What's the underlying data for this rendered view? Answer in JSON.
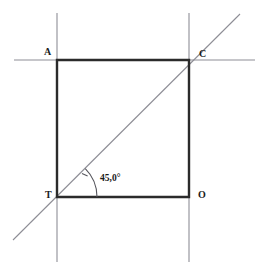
{
  "figure": {
    "width": 271,
    "height": 274,
    "background_color": "#ffffff"
  },
  "colors": {
    "square_stroke": "#2b2b2b",
    "construction_stroke": "#8e8e96",
    "diagonal_stroke": "#8e8e96",
    "arc_stroke": "#55555c",
    "label_color": "#1a1a1a"
  },
  "square": {
    "name": "TACO",
    "stroke_width": 2.4,
    "vertices": [
      {
        "id": "A",
        "label": "A",
        "x": 57,
        "y": 60
      },
      {
        "id": "C",
        "label": "C",
        "x": 189,
        "y": 60
      },
      {
        "id": "O",
        "label": "O",
        "x": 189,
        "y": 197
      },
      {
        "id": "T",
        "label": "T",
        "x": 57,
        "y": 197
      }
    ],
    "edges": [
      {
        "id": "AC",
        "from": "A",
        "to": "C"
      },
      {
        "id": "CO",
        "from": "C",
        "to": "O"
      },
      {
        "id": "OT",
        "from": "O",
        "to": "T"
      },
      {
        "id": "TA",
        "from": "T",
        "to": "A"
      }
    ]
  },
  "labels": {
    "A": {
      "text": "A",
      "x": 44,
      "y": 47
    },
    "C": {
      "text": "C",
      "x": 199,
      "y": 49
    },
    "T": {
      "text": "T",
      "x": 45,
      "y": 190
    },
    "O": {
      "text": "O",
      "x": 198,
      "y": 190
    }
  },
  "construction_lines": [
    {
      "id": "vertical-left",
      "orientation": "vertical",
      "x1": 57,
      "y1": 13,
      "x2": 57,
      "y2": 262
    },
    {
      "id": "vertical-right",
      "orientation": "vertical",
      "x1": 189,
      "y1": 13,
      "x2": 189,
      "y2": 262
    },
    {
      "id": "horizontal-top",
      "orientation": "horizontal",
      "x1": 14,
      "y1": 60,
      "x2": 255,
      "y2": 60
    }
  ],
  "diagonal": {
    "id": "diagonal-TC",
    "through": [
      "T",
      "C"
    ],
    "x1": 13,
    "y1": 240,
    "x2": 240,
    "y2": 14,
    "stroke_width": 1.1
  },
  "angle": {
    "id": "angle-at-T",
    "vertex": "T",
    "value_text": "45,0°",
    "degrees": 45.0,
    "radius": 40,
    "start_angle_deg": 0,
    "end_angle_deg": 45,
    "arc_path": "M 97 197 A 40 40 0 0 0 85.28 168.72",
    "tick_path": "M 82.0 173.6 L 87.6 176.0",
    "label": {
      "text": "45,0°",
      "x": 100,
      "y": 174
    }
  },
  "chart_data": {
    "type": "diagram",
    "shapes": [
      {
        "kind": "square",
        "label": "TACO",
        "points": [
          [
            57,
            197
          ],
          [
            57,
            60
          ],
          [
            189,
            60
          ],
          [
            189,
            197
          ]
        ],
        "side_length_px": 132
      },
      {
        "kind": "line",
        "label": "diagonal TC",
        "points": [
          [
            13,
            240
          ],
          [
            240,
            14
          ]
        ]
      },
      {
        "kind": "line",
        "label": "construction vertical through T and A",
        "points": [
          [
            57,
            13
          ],
          [
            57,
            262
          ]
        ]
      },
      {
        "kind": "line",
        "label": "construction vertical through C and O",
        "points": [
          [
            189,
            13
          ],
          [
            189,
            262
          ]
        ]
      },
      {
        "kind": "line",
        "label": "construction horizontal through A and C",
        "points": [
          [
            14,
            60
          ],
          [
            255,
            60
          ]
        ]
      },
      {
        "kind": "angle-arc",
        "label": "45,0°",
        "vertex": [
          57,
          197
        ],
        "radius": 40,
        "from_deg": 0,
        "to_deg": 45
      }
    ],
    "annotations": [
      "A",
      "C",
      "T",
      "O",
      "45,0°"
    ]
  }
}
